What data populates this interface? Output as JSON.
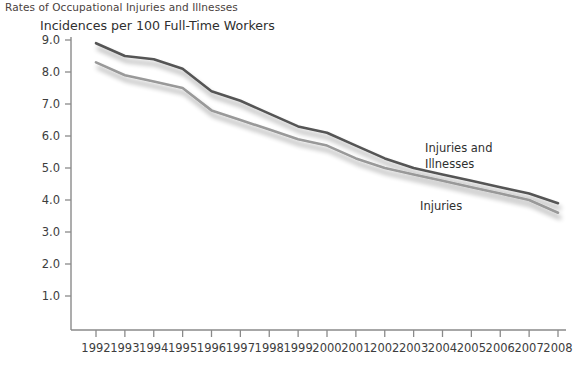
{
  "header": {
    "title": "Rates of Occupational Injuries and Illnesses"
  },
  "chart_data": {
    "type": "line",
    "title": "Rates of Occupational Injuries and Illnesses",
    "subtitle": "Incidences per 100 Full-Time Workers",
    "xlabel": "",
    "ylabel": "Incidences per 100 Full-Time Workers",
    "grid": false,
    "legend_position": "inline-annotation",
    "xlim": [
      1992,
      2008
    ],
    "ylim": [
      0,
      9.0
    ],
    "yticks": [
      "9.0",
      "8.0",
      "7.0",
      "6.0",
      "5.0",
      "4.0",
      "3.0",
      "2.0",
      "1.0"
    ],
    "ytick_values": [
      9.0,
      8.0,
      7.0,
      6.0,
      5.0,
      4.0,
      3.0,
      2.0,
      1.0
    ],
    "categories": [
      "1992",
      "1993",
      "1994",
      "1995",
      "1996",
      "1997",
      "1998",
      "1999",
      "2000",
      "2001",
      "2002",
      "2003",
      "2004",
      "2005",
      "2006",
      "2007",
      "2008"
    ],
    "x": [
      1992,
      1993,
      1994,
      1995,
      1996,
      1997,
      1998,
      1999,
      2000,
      2001,
      2002,
      2003,
      2004,
      2005,
      2006,
      2007,
      2008
    ],
    "series": [
      {
        "name": "Injuries and Illnesses",
        "color": "#555555",
        "values": [
          8.9,
          8.5,
          8.4,
          8.1,
          7.4,
          7.1,
          6.7,
          6.3,
          6.1,
          5.7,
          5.3,
          5.0,
          4.8,
          4.6,
          4.4,
          4.2,
          3.9
        ]
      },
      {
        "name": "Injuries",
        "color": "#999999",
        "values": [
          8.3,
          7.9,
          7.7,
          7.5,
          6.8,
          6.5,
          6.2,
          5.9,
          5.7,
          5.3,
          5.0,
          4.8,
          4.6,
          4.4,
          4.2,
          4.0,
          3.6
        ]
      }
    ],
    "annotations": [
      {
        "text": "Injuries and",
        "x": 425,
        "y": 152
      },
      {
        "text": "Illnesses",
        "x": 425,
        "y": 168
      },
      {
        "text": "Injuries",
        "x": 420,
        "y": 210
      }
    ]
  }
}
